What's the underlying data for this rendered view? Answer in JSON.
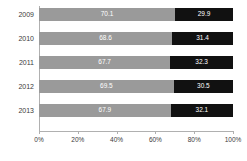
{
  "chart_data": {
    "type": "bar",
    "orientation": "horizontal",
    "stacked": true,
    "stack_mode": "percent",
    "title": "",
    "subtitle": "",
    "xlabel": "",
    "ylabel": "",
    "xlim": [
      0,
      100
    ],
    "grid": false,
    "legend": null,
    "categories": [
      "2009",
      "2010",
      "2011",
      "2012",
      "2013"
    ],
    "xticks": [
      0,
      20,
      40,
      60,
      80,
      100
    ],
    "xtick_labels": [
      "0%",
      "20%",
      "40%",
      "60%",
      "80%",
      "100%"
    ],
    "series": [
      {
        "name": "series-1",
        "color": "#9a9a9a",
        "values": [
          70.1,
          68.6,
          67.7,
          69.5,
          67.9
        ],
        "labels": [
          "70.1",
          "68.6",
          "67.7",
          "69.5",
          "67.9"
        ]
      },
      {
        "name": "series-2",
        "color": "#111111",
        "values": [
          29.9,
          31.4,
          32.3,
          30.5,
          32.1
        ],
        "labels": [
          "29.9",
          "31.4",
          "32.3",
          "30.5",
          "32.1"
        ]
      }
    ]
  },
  "colors": {
    "series_1": "#9a9a9a",
    "series_2": "#111111",
    "axis": "#b0b0b0",
    "text": "#3a3a3a",
    "label_text": "#ffffff",
    "background": "#ffffff"
  }
}
